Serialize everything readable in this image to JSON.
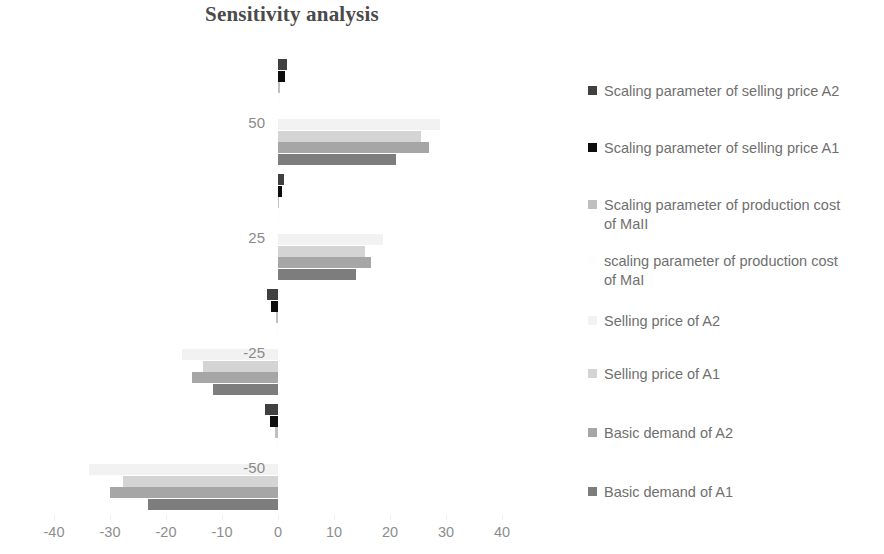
{
  "chart_data": {
    "type": "bar",
    "orientation": "horizontal",
    "title": "Sensitivity analysis",
    "xlabel": "",
    "ylabel": "",
    "xlim": [
      -40,
      40
    ],
    "xticks": [
      "-40",
      "-30",
      "-20",
      "-10",
      "0",
      "10",
      "20",
      "30",
      "40"
    ],
    "xtick_values": [
      -40,
      -30,
      -20,
      -10,
      0,
      10,
      20,
      30,
      40
    ],
    "grid": false,
    "legend_position": "right",
    "categories": [
      "50",
      "25",
      "-25",
      "-50"
    ],
    "series": [
      {
        "name": "Scaling parameter of selling price A2",
        "color": "#404040",
        "values": [
          1.6,
          1.1,
          -1.9,
          -2.3
        ]
      },
      {
        "name": "Scaling parameter of selling price A1",
        "color": "#0d0d0d",
        "values": [
          1.2,
          0.8,
          -1.2,
          -1.5
        ]
      },
      {
        "name": "Scaling parameter of production cost of MaII",
        "color": "#bfbfbf",
        "values": [
          0.35,
          0.2,
          -0.3,
          -0.45
        ]
      },
      {
        "name": "scaling parameter of production cost of MaI",
        "color": "#fbfbfb",
        "values": [
          0.1,
          0.05,
          -0.1,
          -0.1
        ]
      },
      {
        "name": "Selling price of A2",
        "color": "#f2f2f2",
        "values": [
          29.0,
          18.7,
          -17.1,
          -33.7
        ]
      },
      {
        "name": "Selling price of A1",
        "color": "#d4d4d4",
        "values": [
          25.5,
          15.5,
          -13.4,
          -27.7
        ]
      },
      {
        "name": "Basic demand of A2",
        "color": "#a6a6a6",
        "values": [
          27.0,
          16.6,
          -15.4,
          -30.0
        ]
      },
      {
        "name": "Basic demand of A1",
        "color": "#7d7d7d",
        "values": [
          21.0,
          14.0,
          -11.6,
          -23.3
        ]
      }
    ]
  },
  "legend": {
    "items": [
      {
        "label": "Scaling parameter of selling price A2",
        "color": "#404040"
      },
      {
        "label": "Scaling parameter of selling price A1",
        "color": "#0d0d0d"
      },
      {
        "label": "Scaling parameter of production cost\nof MaII",
        "color": "#bfbfbf"
      },
      {
        "label": "scaling parameter of production cost\nof MaI",
        "color": "#fdfdfd"
      },
      {
        "label": "Selling price of A2",
        "color": "#f2f2f2"
      },
      {
        "label": "Selling price of A1",
        "color": "#d4d4d4"
      },
      {
        "label": "Basic demand of A2",
        "color": "#a6a6a6"
      },
      {
        "label": "Basic demand of A1",
        "color": "#7d7d7d"
      }
    ]
  }
}
